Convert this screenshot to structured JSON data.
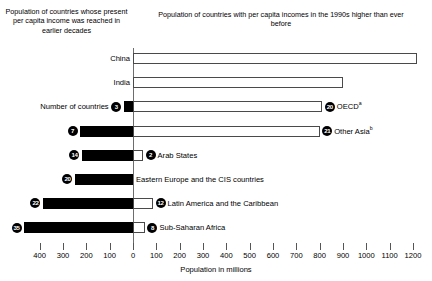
{
  "headers": {
    "left": "Population of countries whose present per capita income was reached in earlier decades",
    "right": "Population of countries with per capita incomes in the 1990s higher than ever before"
  },
  "axis": {
    "title": "Population in millions",
    "ticks": [
      400,
      300,
      200,
      100,
      0,
      100,
      200,
      300,
      400,
      500,
      600,
      700,
      800,
      900,
      1000,
      1100,
      1200
    ],
    "tick_labels": [
      "400",
      "300",
      "200",
      "100",
      "0",
      "100",
      "200",
      "300",
      "400",
      "500",
      "600",
      "700",
      "800",
      "900",
      "1000",
      "1100",
      "1200"
    ]
  },
  "legend_note": {
    "countries_label": "Number of countries"
  },
  "colors": {
    "solid_bar": "#000000",
    "open_bar_fill": "#ffffff",
    "open_bar_stroke": "#4a4a4a",
    "axis_line": "#6d6d6d",
    "badge_fill": "#000000",
    "badge_text": "#ffffff",
    "text": "#000000",
    "background": "#ffffff"
  },
  "chart_data": {
    "type": "bar",
    "orientation": "horizontal",
    "layout": "diverging",
    "title": "",
    "xlabel": "Population in millions",
    "ylabel": "",
    "xlim": [
      -450,
      1250
    ],
    "grid": false,
    "legend": "none",
    "series": [
      {
        "name": "Population of countries whose present per capita income was reached in earlier decades",
        "side": "left",
        "style": "solid-black"
      },
      {
        "name": "Population of countries with per capita incomes in the 1990s higher than ever before",
        "side": "right",
        "style": "open-outline"
      }
    ],
    "rows": [
      {
        "label": "China",
        "label_side": "left-axis",
        "left_value": 0,
        "left_countries": null,
        "right_value": 1218,
        "right_countries": null,
        "right_label": ""
      },
      {
        "label": "India",
        "label_side": "left-axis",
        "left_value": 0,
        "left_countries": null,
        "right_value": 901,
        "right_countries": null,
        "right_label": ""
      },
      {
        "label": "Number of countries",
        "label_side": "left-text",
        "left_value": 40,
        "left_countries": 3,
        "right_value": 811,
        "right_countries": 20,
        "right_label": "OECD",
        "right_label_sup": "a"
      },
      {
        "label": "",
        "label_side": "none",
        "left_value": 227,
        "left_countries": 7,
        "right_value": 800,
        "right_countries": 21,
        "right_label": "Other Asia",
        "right_label_sup": "b"
      },
      {
        "label": "",
        "label_side": "none",
        "left_value": 219,
        "left_countries": 14,
        "right_value": 43,
        "right_countries": 2,
        "right_label": "Arab States"
      },
      {
        "label": "",
        "label_side": "none",
        "left_value": 249,
        "left_countries": 20,
        "right_value": 0,
        "right_countries": null,
        "right_label": "Eastern Europe and the CIS countries"
      },
      {
        "label": "",
        "label_side": "none",
        "left_value": 386,
        "left_countries": 22,
        "right_value": 86,
        "right_countries": 12,
        "right_label": "Latin America and the Caribbean"
      },
      {
        "label": "",
        "label_side": "none",
        "left_value": 467,
        "left_countries": 35,
        "right_value": 51,
        "right_countries": 8,
        "right_label": "Sub-Saharan Africa"
      }
    ]
  }
}
